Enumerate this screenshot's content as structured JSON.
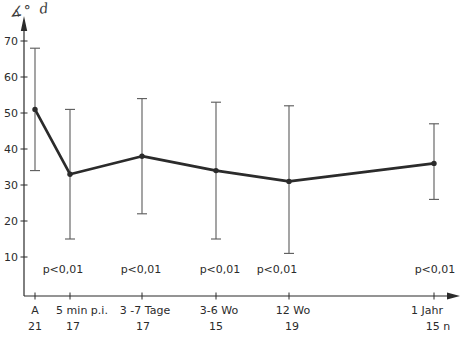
{
  "chart_data": {
    "type": "line",
    "title": "",
    "ylabel": "∡° d",
    "xlabel": "",
    "categories": [
      "A",
      "5 min p.i.",
      "3 -7 Tage",
      "3-6 Wo",
      "12 Wo",
      "1 Jahr"
    ],
    "sample_sizes": [
      "21",
      "17",
      "17",
      "15",
      "19",
      "15 n"
    ],
    "significance_labels": [
      "",
      "p<0,01",
      "p<0,01",
      "p<0,01",
      "p<0,01",
      "p<0,01"
    ],
    "series": [
      {
        "name": "mean with error bars",
        "values": [
          51,
          33,
          38,
          34,
          31,
          36
        ],
        "error_low": [
          34,
          15,
          22,
          15,
          11,
          26
        ],
        "error_high": [
          68,
          51,
          54,
          53,
          52,
          47
        ]
      }
    ],
    "y_ticks": [
      10,
      20,
      30,
      40,
      50,
      60,
      70
    ],
    "ylim": [
      0,
      75
    ],
    "grid": false,
    "legend": "none",
    "x_positions_px": [
      35,
      70,
      142,
      216,
      289,
      434
    ],
    "category_label_x_px": [
      35,
      82,
      145,
      219,
      293,
      427
    ],
    "n_label_x_px": [
      35,
      73,
      143,
      216,
      292,
      438
    ],
    "p_label_x_px": [
      0,
      63,
      141,
      220,
      277,
      435
    ],
    "colors": {
      "ink": "#2b2b2b",
      "error_bar": "#5a5a5a",
      "background": "#ffffff"
    }
  }
}
